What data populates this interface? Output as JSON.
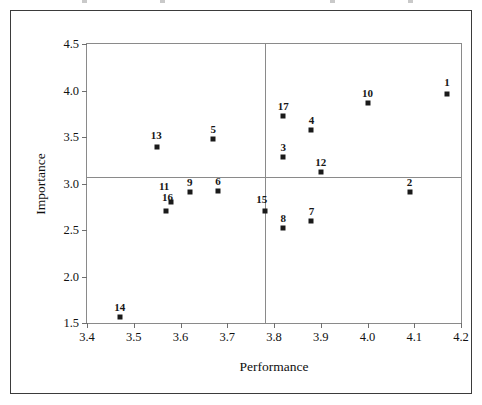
{
  "figure": {
    "width": 482,
    "height": 405,
    "background": "#ffffff",
    "frame_color": "#3b3b3b",
    "plot_border_color": "#8a8a8a",
    "marker_color": "#1a1a1a"
  },
  "chart_data": {
    "type": "scatter",
    "title": "",
    "xlabel": "Performance",
    "ylabel": "Importance",
    "xlim": [
      3.4,
      4.2
    ],
    "ylim": [
      1.5,
      4.5
    ],
    "xticks": [
      3.4,
      3.5,
      3.6,
      3.7,
      3.8,
      3.9,
      4.0,
      4.1,
      4.2
    ],
    "xticklabels": [
      "3.4",
      "3.5",
      "3.6",
      "3.7",
      "3.8",
      "3.9",
      "4.0",
      "4.1",
      "4.2"
    ],
    "yticks": [
      1.5,
      2.0,
      2.5,
      3.0,
      3.5,
      4.0,
      4.5
    ],
    "yticklabels": [
      "1.5",
      "2.0",
      "2.5",
      "3.0",
      "3.5",
      "4.0",
      "4.5"
    ],
    "grid": false,
    "legend": null,
    "reference_lines": [
      {
        "orientation": "vertical",
        "value": 3.78,
        "color": "#8a8a8a"
      },
      {
        "orientation": "horizontal",
        "value": 3.07,
        "color": "#8a8a8a"
      }
    ],
    "marker": "square",
    "point_label_position": "above",
    "points": [
      {
        "label": "1",
        "x": 4.17,
        "y": 3.96
      },
      {
        "label": "2",
        "x": 4.09,
        "y": 2.91
      },
      {
        "label": "3",
        "x": 3.82,
        "y": 3.29
      },
      {
        "label": "4",
        "x": 3.88,
        "y": 3.58
      },
      {
        "label": "5",
        "x": 3.67,
        "y": 3.48
      },
      {
        "label": "6",
        "x": 3.68,
        "y": 2.92
      },
      {
        "label": "7",
        "x": 3.88,
        "y": 2.6
      },
      {
        "label": "8",
        "x": 3.82,
        "y": 2.52
      },
      {
        "label": "9",
        "x": 3.62,
        "y": 2.91
      },
      {
        "label": "10",
        "x": 4.0,
        "y": 3.87
      },
      {
        "label": "11",
        "x": 3.58,
        "y": 2.8
      },
      {
        "label": "12",
        "x": 3.9,
        "y": 3.12
      },
      {
        "label": "13",
        "x": 3.55,
        "y": 3.39
      },
      {
        "label": "14",
        "x": 3.47,
        "y": 1.56
      },
      {
        "label": "15",
        "x": 3.78,
        "y": 2.7
      },
      {
        "label": "16",
        "x": 3.57,
        "y": 2.7
      },
      {
        "label": "17",
        "x": 3.82,
        "y": 3.73
      }
    ],
    "label_offsets": {
      "11": {
        "dx": -7,
        "dy": -6
      },
      "16": {
        "dx": 1,
        "dy": -4
      },
      "15": {
        "dx": -3,
        "dy": -2
      },
      "1": {
        "dx": 0,
        "dy": -2
      },
      "13": {
        "dx": -1,
        "dy": -2
      }
    }
  }
}
